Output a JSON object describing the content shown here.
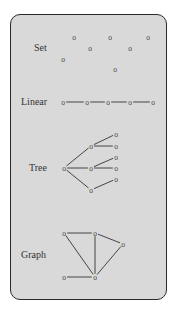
{
  "panel": {
    "background": "#d9d9d9",
    "border": "#2a2a2a"
  },
  "sections": [
    {
      "id": "set",
      "label": "Set",
      "label_pos": [
        34,
        51
      ],
      "nodes": [
        [
          74,
          37
        ],
        [
          110,
          37
        ],
        [
          148,
          37
        ],
        [
          90,
          48
        ],
        [
          130,
          48
        ],
        [
          63,
          59
        ],
        [
          115,
          69
        ]
      ],
      "edges": []
    },
    {
      "id": "linear",
      "label": "Linear",
      "label_pos": [
        21,
        105
      ],
      "nodes": [
        [
          63,
          102
        ],
        [
          87,
          102
        ],
        [
          108,
          102
        ],
        [
          130,
          102
        ],
        [
          153,
          102
        ]
      ],
      "edges": [
        [
          0,
          1
        ],
        [
          1,
          2
        ],
        [
          2,
          3
        ],
        [
          3,
          4
        ]
      ]
    },
    {
      "id": "tree",
      "label": "Tree",
      "label_pos": [
        29,
        171
      ],
      "nodes": [
        [
          64,
          168
        ],
        [
          91,
          146
        ],
        [
          91,
          168
        ],
        [
          91,
          190
        ],
        [
          116,
          134
        ],
        [
          116,
          146
        ],
        [
          116,
          157
        ],
        [
          116,
          168
        ],
        [
          116,
          179
        ]
      ],
      "edges": [
        [
          0,
          1
        ],
        [
          0,
          2
        ],
        [
          0,
          3
        ],
        [
          1,
          4
        ],
        [
          1,
          5
        ],
        [
          2,
          6
        ],
        [
          2,
          7
        ],
        [
          3,
          8
        ]
      ]
    },
    {
      "id": "graph",
      "label": "Graph",
      "label_pos": [
        21,
        258
      ],
      "nodes": [
        [
          64,
          233
        ],
        [
          95,
          233
        ],
        [
          123,
          244
        ],
        [
          64,
          277
        ],
        [
          95,
          277
        ]
      ],
      "edges": [
        [
          0,
          1
        ],
        [
          1,
          2
        ],
        [
          0,
          4
        ],
        [
          1,
          4
        ],
        [
          2,
          4
        ],
        [
          3,
          4
        ]
      ]
    }
  ],
  "node_glyph": "o"
}
